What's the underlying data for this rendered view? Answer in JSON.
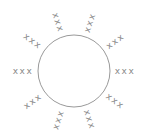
{
  "diagram": {
    "circle": {
      "cx": 74,
      "cy": 71,
      "r": 36,
      "stroke": "#9a9a9a"
    },
    "label_color": "#8a8a8a",
    "labels": [
      {
        "text": "xxx",
        "angle": 0
      },
      {
        "text": "xxx",
        "angle": 36
      },
      {
        "text": "xxx",
        "angle": 72
      },
      {
        "text": "xxx",
        "angle": 108
      },
      {
        "text": "xxx",
        "angle": 144
      },
      {
        "text": "xxx",
        "angle": 180
      },
      {
        "text": "xxx",
        "angle": 216
      },
      {
        "text": "xxx",
        "angle": 252
      },
      {
        "text": "xxx",
        "angle": 288
      },
      {
        "text": "xxx",
        "angle": 324
      }
    ],
    "label_offset": 15
  }
}
